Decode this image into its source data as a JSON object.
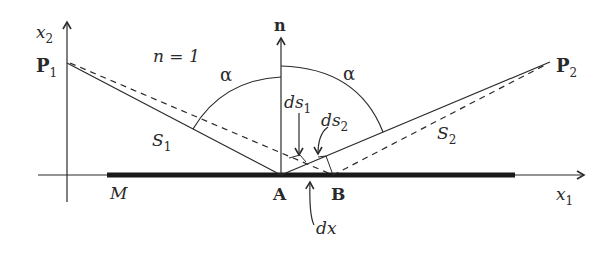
{
  "figure": {
    "labels": {
      "x2_axis": {
        "main": "x",
        "sub": "2"
      },
      "x1_axis": {
        "main": "x",
        "sub": "1"
      },
      "p1": {
        "main": "P",
        "sub": "1"
      },
      "p2": {
        "main": "P",
        "sub": "2"
      },
      "refractive_index": "n = 1",
      "normal": "n",
      "alpha_left": "α",
      "alpha_right": "α",
      "ds1": {
        "main": "ds",
        "sub": "1"
      },
      "ds2": {
        "main": "ds",
        "sub": "2"
      },
      "s1": {
        "main": "S",
        "sub": "1"
      },
      "s2": {
        "main": "S",
        "sub": "2"
      },
      "mirror": "M",
      "point_a": "A",
      "point_b": "B",
      "dx": "dx"
    },
    "colors": {
      "ink": "#2a2a2a",
      "mirror": "#1a1a1a",
      "background": "#ffffff"
    }
  }
}
